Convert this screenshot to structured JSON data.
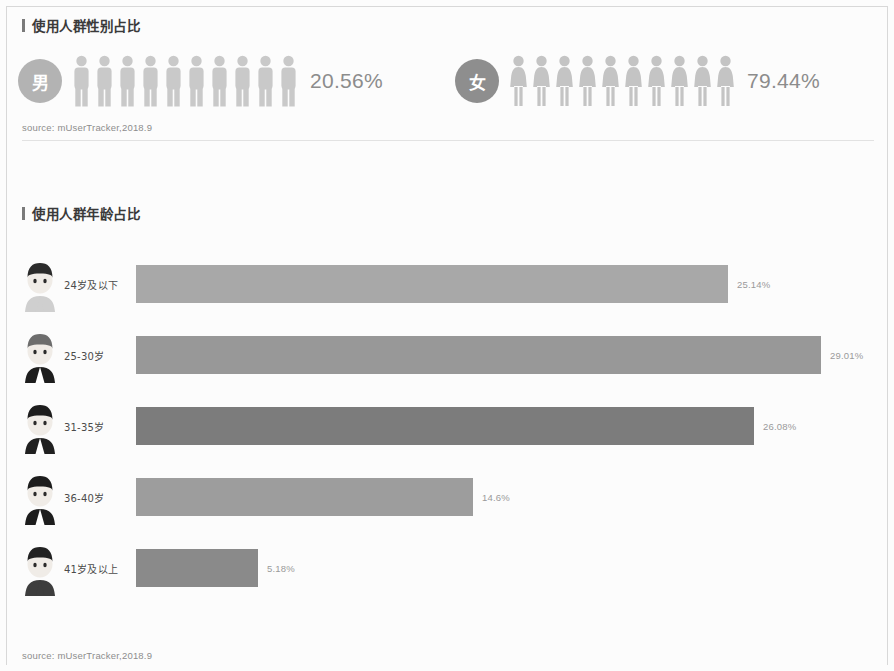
{
  "theme": {
    "page_bg": "#fcfcfc",
    "title_color": "#3a3a3a",
    "title_bar_color": "#7a7a7a",
    "source_color": "#8d8d8d",
    "divider_color": "#e2e2e2",
    "male_badge_color": "#b3b3b3",
    "female_badge_color": "#8e8e8e",
    "male_person_color": "#c9c9c9",
    "female_person_color": "#c4c4c4",
    "gender_pct_color": "#8c8c8c",
    "bar_value_color": "#9a9a9a"
  },
  "gender_section": {
    "title": "使用人群性别占比",
    "source": "source:  mUserTracker,2018.9",
    "groups": [
      {
        "badge": "男",
        "badge_color": "#b3b3b3",
        "person_color": "#c9c9c9",
        "person_icon": "male-person-icon",
        "icon_count": 10,
        "percent_label": "20.56%",
        "value": 20.56
      },
      {
        "badge": "女",
        "badge_color": "#8e8e8e",
        "person_color": "#c4c4c4",
        "person_icon": "female-person-icon",
        "icon_count": 10,
        "percent_label": "79.44%",
        "value": 79.44
      }
    ]
  },
  "age_section": {
    "title": "使用人群年龄占比",
    "source": "source:  mUserTracker,2018.9",
    "rows": [
      {
        "label": "24岁及以下",
        "value_label": "25.14%",
        "value": 25.14,
        "bar_width": 592,
        "bar_color": "#a8a8a8",
        "avatar": "avatar-young-man-icon"
      },
      {
        "label": "25-30岁",
        "value_label": "29.01%",
        "value": 29.01,
        "bar_width": 685,
        "bar_color": "#989898",
        "avatar": "avatar-suited-man-icon"
      },
      {
        "label": "31-35岁",
        "value_label": "26.08%",
        "value": 26.08,
        "bar_width": 618,
        "bar_color": "#7c7c7c",
        "avatar": "avatar-businessman-icon"
      },
      {
        "label": "36-40岁",
        "value_label": "14.6%",
        "value": 14.6,
        "bar_width": 337,
        "bar_color": "#9d9d9d",
        "avatar": "avatar-mustache-man-icon"
      },
      {
        "label": "41岁及以上",
        "value_label": "5.18%",
        "value": 5.18,
        "bar_width": 122,
        "bar_color": "#8a8a8a",
        "avatar": "avatar-older-man-icon"
      }
    ]
  },
  "chart_data": [
    {
      "type": "pie",
      "title": "使用人群性别占比",
      "subtitle": "",
      "xlabel": "",
      "ylabel": "",
      "categories": [
        "男",
        "女"
      ],
      "values": [
        20.56,
        79.44
      ],
      "value_labels": [
        "20.56%",
        "79.44%"
      ],
      "units": "percent",
      "annotations": [
        "source:  mUserTracker,2018.9"
      ],
      "legend": "none",
      "grid": false,
      "note": "rendered as pictogram rows of 10 person icons per gender"
    },
    {
      "type": "bar",
      "title": "使用人群年龄占比",
      "subtitle": "",
      "orientation": "horizontal",
      "categories": [
        "24岁及以下",
        "25-30岁",
        "31-35岁",
        "36-40岁",
        "41岁及以上"
      ],
      "values": [
        25.14,
        29.01,
        26.08,
        14.6,
        5.18
      ],
      "value_labels": [
        "25.14%",
        "29.01%",
        "26.08%",
        "14.6%",
        "5.18%"
      ],
      "xlabel": "",
      "ylabel": "",
      "xlim": [
        0,
        30
      ],
      "units": "percent",
      "annotations": [
        "source:  mUserTracker,2018.9"
      ],
      "legend": "none",
      "grid": false
    }
  ]
}
